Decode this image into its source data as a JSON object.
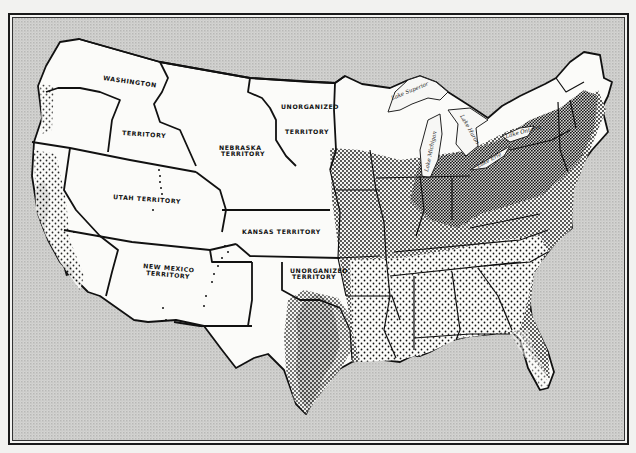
{
  "map": {
    "subject": "Population distribution of the United States",
    "colors": {
      "background": "#c8c8c8",
      "land": "#fbfbf9",
      "ink": "#111111",
      "frame": "#1a1a1a"
    },
    "territory_labels": [
      {
        "id": "washington",
        "line1": "WASHINGTON",
        "line2": "TERRITORY"
      },
      {
        "id": "nebraska",
        "line1": "NEBRASKA",
        "line2": "TERRITORY"
      },
      {
        "id": "unorganized-north",
        "line1": "UNORGANIZED",
        "line2": "TERRITORY"
      },
      {
        "id": "utah",
        "line1": "UTAH TERRITORY"
      },
      {
        "id": "kansas",
        "line1": "KANSAS TERRITORY"
      },
      {
        "id": "new-mexico",
        "line1": "NEW MEXICO",
        "line2": "TERRITORY"
      },
      {
        "id": "unorganized-south",
        "line1": "UNORGANIZED",
        "line2": "TERRITORY"
      }
    ],
    "lake_labels": [
      {
        "id": "superior",
        "text": "Lake Superior"
      },
      {
        "id": "michigan",
        "text": "Lake Michigan"
      },
      {
        "id": "huron",
        "text": "Lake Huron"
      },
      {
        "id": "ontario",
        "text": "Lake Ontario"
      },
      {
        "id": "erie",
        "text": "Lake Erie"
      }
    ]
  }
}
